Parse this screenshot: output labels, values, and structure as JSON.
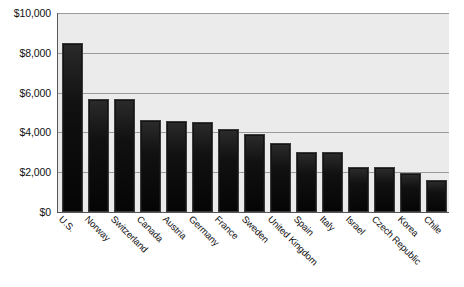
{
  "chart_data": {
    "type": "bar",
    "title": "",
    "xlabel": "",
    "ylabel": "",
    "ylim": [
      0,
      10000
    ],
    "grid": true,
    "legend": null,
    "categories": [
      "U.S.",
      "Norway",
      "Switzerland",
      "Canada",
      "Austria",
      "Germany",
      "France",
      "Sweden",
      "United Kingdom",
      "Spain",
      "Italy",
      "Israel",
      "Czech Republic",
      "Korea",
      "Chile"
    ],
    "values": [
      8500,
      5700,
      5700,
      4600,
      4550,
      4520,
      4170,
      3920,
      3470,
      3020,
      3000,
      2260,
      2250,
      1960,
      1610
    ],
    "y_ticks": [
      {
        "value": 10000,
        "label": "$10,000"
      },
      {
        "value": 8000,
        "label": "$8,000"
      },
      {
        "value": 6000,
        "label": "$6,000"
      },
      {
        "value": 4000,
        "label": "$4,000"
      },
      {
        "value": 2000,
        "label": "$2,000"
      },
      {
        "value": 0,
        "label": "$0"
      }
    ],
    "bar_color": "#141414",
    "plot_background": "#ebebeb",
    "gridline_color": "#9a9a9a",
    "axis_color": "#575757"
  },
  "caption": {
    "text": ""
  }
}
